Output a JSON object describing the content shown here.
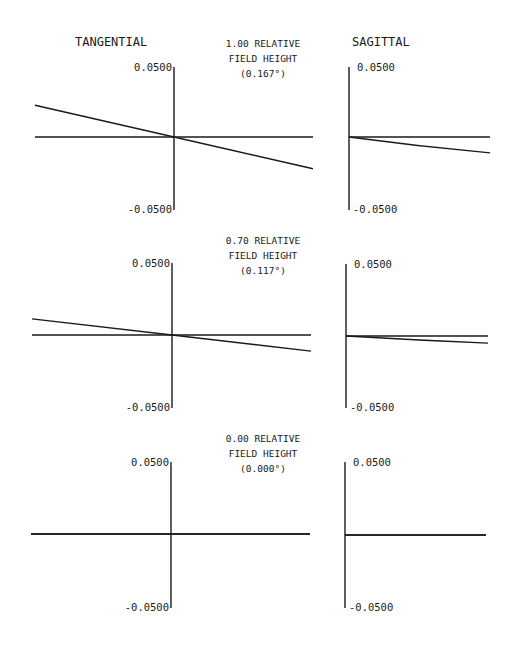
{
  "chart_data": {
    "type": "line",
    "column_headers": {
      "tangential": "TANGENTIAL",
      "sagittal": "SAGITTAL"
    },
    "ylim": [
      -0.05,
      0.05
    ],
    "tick_labels": {
      "top": "0.0500",
      "bottom": "-0.0500"
    },
    "grid": false,
    "legend": null,
    "fields": [
      {
        "label_line1": "1.00 RELATIVE",
        "label_line2": "FIELD HEIGHT",
        "label_line3": "(0.167°)",
        "relative_field": 1.0,
        "angle_deg": 0.167,
        "tangential": {
          "x": [
            -1,
            0,
            1
          ],
          "y": [
            0.0222,
            0.0,
            -0.0222
          ]
        },
        "sagittal": {
          "x": [
            0,
            1
          ],
          "y": [
            0.0,
            -0.0111
          ]
        }
      },
      {
        "label_line1": "0.70 RELATIVE",
        "label_line2": "FIELD HEIGHT",
        "label_line3": "(0.117°)",
        "relative_field": 0.7,
        "angle_deg": 0.117,
        "tangential": {
          "x": [
            -1,
            0,
            1
          ],
          "y": [
            0.0111,
            0.0,
            -0.0111
          ]
        },
        "sagittal": {
          "x": [
            0,
            1
          ],
          "y": [
            0.0,
            -0.0049
          ]
        }
      },
      {
        "label_line1": "0.00 RELATIVE",
        "label_line2": "FIELD HEIGHT",
        "label_line3": "(0.000°)",
        "relative_field": 0.0,
        "angle_deg": 0.0,
        "tangential": {
          "x": [
            -1,
            0,
            1
          ],
          "y": [
            0.0,
            0.0,
            0.0
          ]
        },
        "sagittal": {
          "x": [
            0,
            1
          ],
          "y": [
            0.0,
            0.0
          ]
        }
      }
    ]
  },
  "layout": {
    "blocks": [
      {
        "tan": {
          "x0": 35,
          "x1": 313,
          "ax": 174,
          "top": 67,
          "bot": 210,
          "y0": 137
        },
        "sag": {
          "x0": 349,
          "x1": 490,
          "top": 67,
          "bot": 210,
          "y0": 137
        },
        "labelY": 47
      },
      {
        "tan": {
          "x0": 32,
          "x1": 311,
          "ax": 172,
          "top": 263,
          "bot": 408,
          "y0": 335
        },
        "sag": {
          "x0": 346,
          "x1": 488,
          "top": 264,
          "bot": 408,
          "y0": 336
        },
        "labelY": 244
      },
      {
        "tan": {
          "x0": 31,
          "x1": 310,
          "ax": 171,
          "top": 462,
          "bot": 608,
          "y0": 534
        },
        "sag": {
          "x0": 345,
          "x1": 486,
          "top": 462,
          "bot": 608,
          "y0": 535
        },
        "labelY": 442
      }
    ]
  }
}
